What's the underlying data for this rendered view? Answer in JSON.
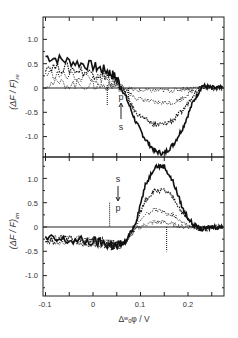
{
  "chart_data": [
    {
      "type": "line",
      "panel": "top",
      "ylabel": "(ΔF/F)re",
      "ylabel_main": "(ΔF / F)",
      "ylabel_sub": "re",
      "xlabel": "",
      "xlim": [
        -0.1,
        0.275
      ],
      "ylim": [
        -1.45,
        1.45
      ],
      "yticks": [
        1.0,
        0.5,
        0,
        -0.5,
        -1.0
      ],
      "ytick_labels": [
        "1.0",
        "0.5",
        "0",
        "-0.5",
        "-1.0"
      ],
      "xticks": [
        -0.1,
        -0.05,
        0,
        0.05,
        0.1,
        0.15,
        0.2,
        0.25
      ],
      "grid": false,
      "annotation": {
        "top": "p",
        "bottom": "s",
        "arrow": "up",
        "x": 0.06
      },
      "x": [
        -0.1,
        -0.05,
        0,
        0.03,
        0.05,
        0.07,
        0.09,
        0.11,
        0.13,
        0.15,
        0.17,
        0.19,
        0.21,
        0.23,
        0.25,
        0.275
      ],
      "series": [
        {
          "name": "s",
          "values": [
            0.65,
            0.55,
            0.45,
            0.35,
            0.2,
            -0.2,
            -0.7,
            -1.05,
            -1.3,
            -1.35,
            -1.15,
            -0.8,
            -0.3,
            0.05,
            0.0,
            0.0
          ]
        },
        {
          "name": "s-mid",
          "values": [
            0.45,
            0.4,
            0.3,
            0.25,
            0.15,
            -0.15,
            -0.5,
            -0.65,
            -0.75,
            -0.75,
            -0.65,
            -0.45,
            -0.15,
            0.05,
            0.0,
            0.0
          ]
        },
        {
          "name": "p-mid",
          "values": [
            0.3,
            0.25,
            0.2,
            0.15,
            0.1,
            -0.05,
            -0.2,
            -0.25,
            -0.3,
            -0.3,
            -0.3,
            -0.2,
            -0.05,
            0.05,
            0.0,
            0.0
          ]
        },
        {
          "name": "p",
          "values": [
            0.1,
            0.08,
            0.05,
            0.05,
            0.05,
            0.0,
            -0.05,
            -0.05,
            -0.05,
            -0.05,
            -0.05,
            -0.02,
            0.0,
            0.02,
            0.0,
            0.0
          ]
        }
      ]
    },
    {
      "type": "line",
      "panel": "bottom",
      "ylabel": "(ΔF/F)im",
      "ylabel_main": "(ΔF / F)",
      "ylabel_sub": "im",
      "xlabel": "Δwoφ / V",
      "xlim": [
        -0.1,
        0.275
      ],
      "ylim": [
        -1.45,
        1.45
      ],
      "yticks": [
        1.0,
        0.5,
        0,
        -0.5,
        -1.0
      ],
      "ytick_labels": [
        "1.0",
        "0.5",
        "0",
        "-0.5",
        "-1.0"
      ],
      "xticks": [
        -0.1,
        -0.05,
        0,
        0.05,
        0.1,
        0.15,
        0.2,
        0.25
      ],
      "xtick_labels": [
        "-0.1",
        "0",
        "0.1",
        "0.2"
      ],
      "grid": false,
      "annotation": {
        "top": "s",
        "bottom": "p",
        "arrow": "down",
        "x": 0.06
      },
      "x": [
        -0.1,
        -0.05,
        0,
        0.03,
        0.05,
        0.07,
        0.09,
        0.11,
        0.13,
        0.15,
        0.17,
        0.19,
        0.21,
        0.23,
        0.25,
        0.275
      ],
      "series": [
        {
          "name": "s",
          "values": [
            -0.25,
            -0.28,
            -0.3,
            -0.35,
            -0.4,
            -0.3,
            0.1,
            0.85,
            1.25,
            1.25,
            0.9,
            0.35,
            0.05,
            -0.05,
            0.0,
            0.0
          ]
        },
        {
          "name": "s-mid",
          "values": [
            -0.25,
            -0.28,
            -0.3,
            -0.35,
            -0.4,
            -0.3,
            0.05,
            0.55,
            0.75,
            0.75,
            0.6,
            0.25,
            0.05,
            -0.05,
            0.0,
            0.0
          ]
        },
        {
          "name": "p-mid",
          "values": [
            -0.25,
            -0.28,
            -0.3,
            -0.35,
            -0.4,
            -0.3,
            0.0,
            0.25,
            0.35,
            0.3,
            0.25,
            0.1,
            0.0,
            -0.05,
            0.0,
            0.0
          ]
        },
        {
          "name": "p",
          "values": [
            -0.25,
            -0.28,
            -0.3,
            -0.35,
            -0.4,
            -0.3,
            -0.05,
            0.05,
            0.1,
            0.1,
            0.05,
            0.0,
            0.0,
            -0.05,
            0.0,
            0.0
          ]
        }
      ]
    }
  ],
  "labels": {
    "top_y_main": "(ΔF / F)",
    "top_y_sub": "re",
    "bottom_y_main": "(ΔF / F)",
    "bottom_y_sub": "im",
    "x_axis": "Δʷₒφ / V",
    "x_tick_neg01": "-0.1",
    "x_tick_0": "0",
    "x_tick_01": "0.1",
    "x_tick_02": "0.2",
    "y_1": "1.0",
    "y_05": "0.5",
    "y_0": "0",
    "y_m05": "-0.5",
    "y_m10": "-1.0",
    "top_p": "p",
    "top_s": "s",
    "bot_s": "s",
    "bot_p": "p"
  }
}
